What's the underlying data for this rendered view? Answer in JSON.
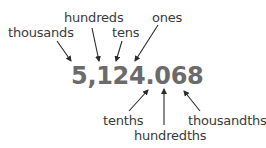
{
  "diagram": {
    "number": "5,124.068",
    "labels_above": [
      {
        "id": "thousands",
        "text": "thousands",
        "x": 8,
        "y": 26
      },
      {
        "id": "hundreds",
        "text": "hundreds",
        "x": 64,
        "y": 11
      },
      {
        "id": "tens",
        "text": "tens",
        "x": 112,
        "y": 26
      },
      {
        "id": "ones",
        "text": "ones",
        "x": 152,
        "y": 11
      }
    ],
    "labels_below": [
      {
        "id": "tenths",
        "text": "tenths",
        "x": 103,
        "y": 114
      },
      {
        "id": "hundredths",
        "text": "hundredths",
        "x": 134,
        "y": 129
      },
      {
        "id": "thousandths",
        "text": "thousandths",
        "x": 188,
        "y": 114
      }
    ],
    "colors": {
      "number": "#6b6b6b",
      "labels": "#3a3a3a",
      "arrows": "#2a2a2a",
      "background": "#ffffff"
    }
  }
}
